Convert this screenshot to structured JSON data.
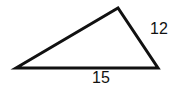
{
  "diagram": {
    "shape": "triangle",
    "vertices": [
      [
        16,
        68
      ],
      [
        118,
        8
      ],
      [
        158,
        68
      ]
    ],
    "stroke_color": "#111111",
    "labels": {
      "right_side": "12",
      "bottom_side": "15"
    }
  }
}
